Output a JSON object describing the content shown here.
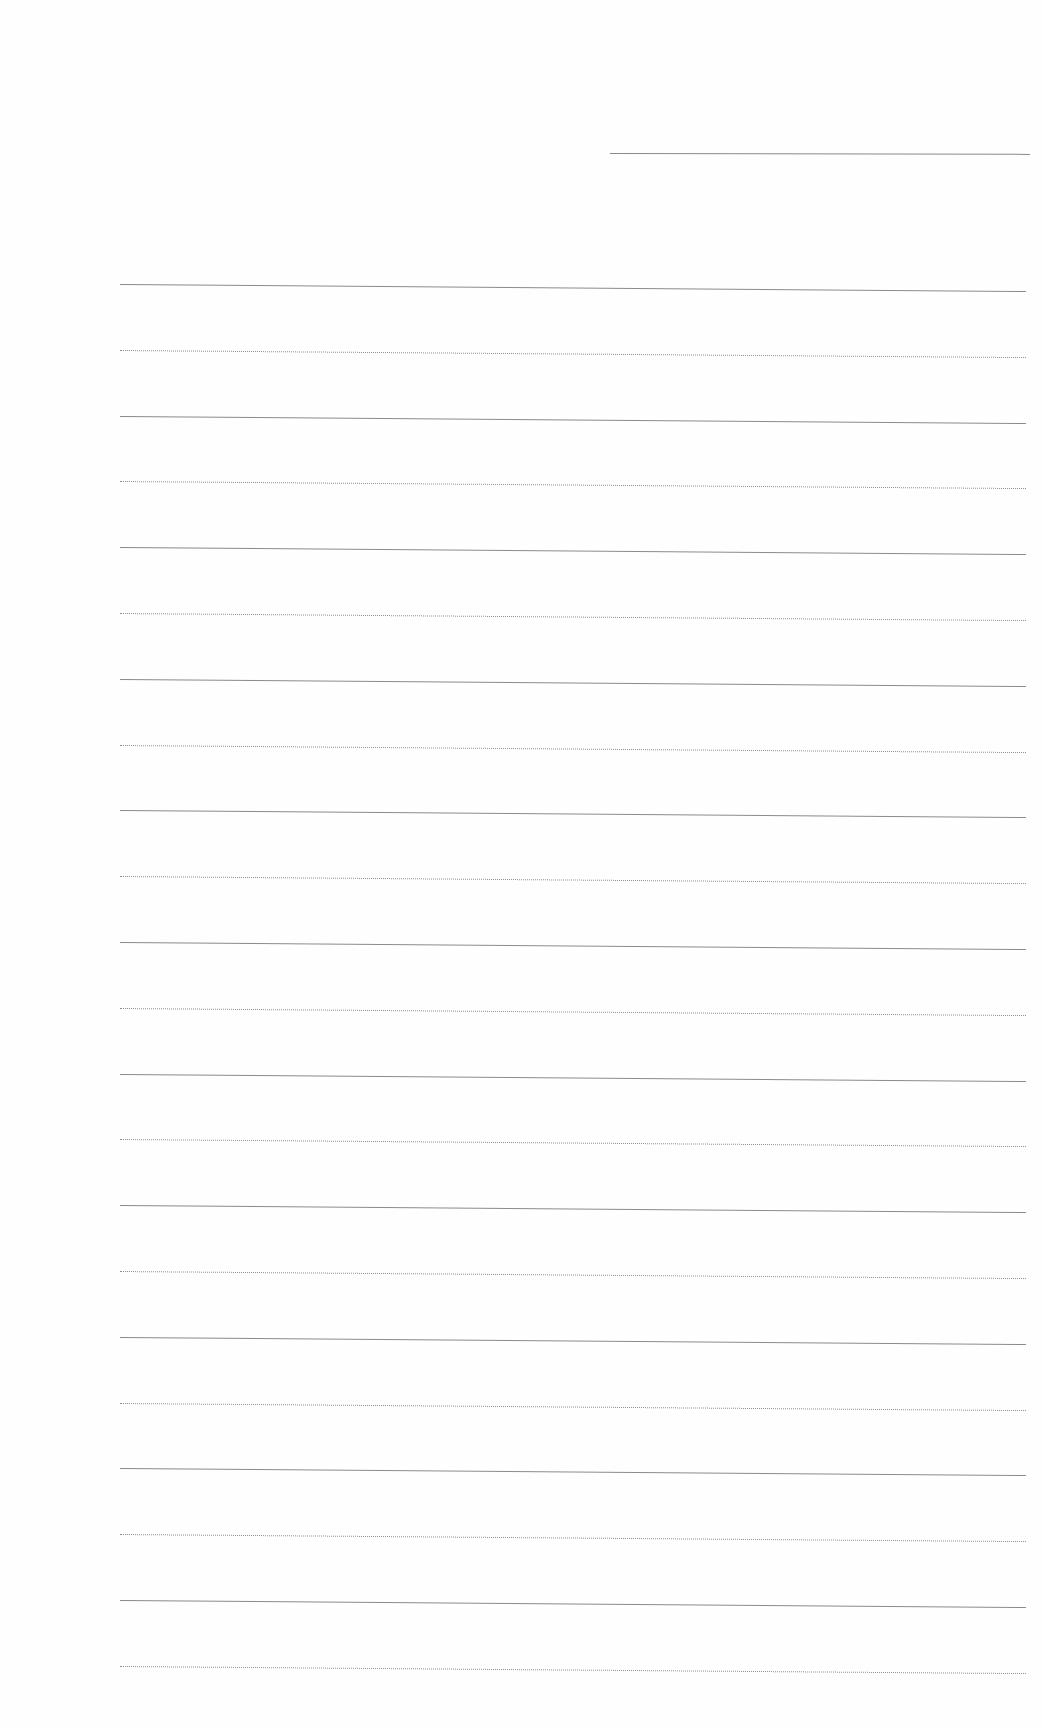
{
  "document": {
    "type": "lined-paper",
    "header_line": {
      "x1": 610,
      "x2": 1030,
      "y": 153
    },
    "ruled_lines": {
      "count": 22,
      "x_start": 120,
      "x_end": 1026,
      "first_y": 284,
      "spacing": 65.8,
      "styles": [
        "solid",
        "dotted",
        "solid",
        "dotted",
        "solid",
        "dotted",
        "solid",
        "dotted",
        "solid",
        "dotted",
        "solid",
        "dotted",
        "solid",
        "dotted",
        "solid",
        "dotted",
        "solid",
        "dotted",
        "solid",
        "dotted",
        "solid",
        "dotted"
      ]
    },
    "line_color": "#8a8a8a",
    "background_color": "#fefefe"
  }
}
